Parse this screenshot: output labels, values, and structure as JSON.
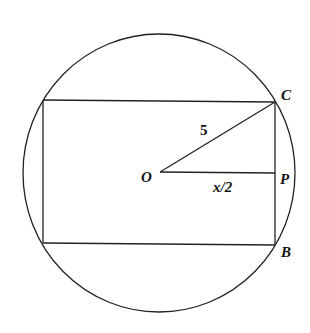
{
  "diagram": {
    "points": {
      "O": "O",
      "C": "C",
      "P": "P",
      "B": "B"
    },
    "segment_labels": {
      "OC": "5",
      "OP": "x/2"
    },
    "colors": {
      "stroke": "#222222",
      "background": "#ffffff"
    }
  }
}
